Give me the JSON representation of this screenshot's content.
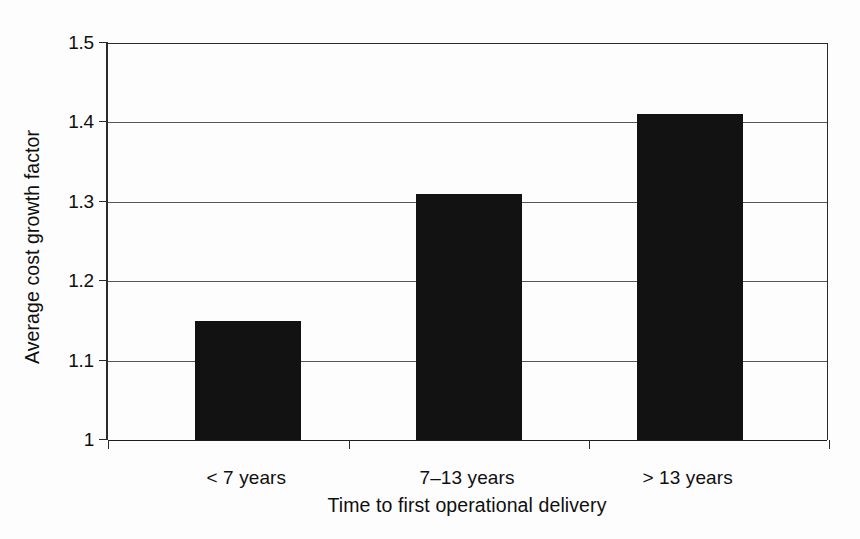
{
  "chart_data": {
    "type": "bar",
    "title": "",
    "subtitle": "",
    "xlabel": "Time to first operational delivery",
    "ylabel": "Average cost growth factor",
    "categories": [
      "< 7 years",
      "7–13 years",
      "> 13 years"
    ],
    "values": [
      1.15,
      1.31,
      1.41
    ],
    "series": [
      {
        "name": "Average cost growth factor",
        "values": [
          1.15,
          1.31,
          1.41
        ]
      }
    ],
    "ylim": [
      1.0,
      1.5
    ],
    "xlim": [
      0,
      3
    ],
    "ytick_labels": [
      "1.5",
      "1.4",
      "1.3",
      "1.2",
      "1.1",
      "1"
    ],
    "ytick_values": [
      1.5,
      1.4,
      1.3,
      1.2,
      1.1,
      1.0
    ],
    "grid": true,
    "grid_axis": "y",
    "legend": false,
    "legend_position": "none",
    "bar_color": "#121212",
    "gridline_color": "#55555a",
    "axis_color": "#2a2a2a",
    "text_color": "#100f0f",
    "background_color": "#fdfdfd",
    "annotations": []
  }
}
